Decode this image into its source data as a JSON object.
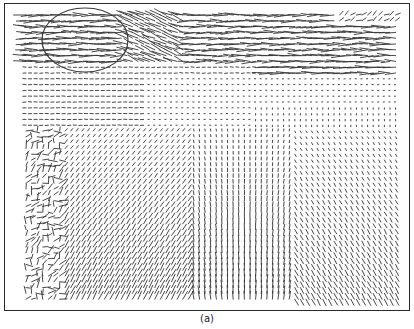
{
  "figure": {
    "caption": "(a)",
    "type": "vector-field",
    "colors": {
      "frame": "#2a2a2a",
      "vectors": "#333333",
      "ellipse": "#3a3a3a",
      "background": "#ffffff"
    },
    "grid": {
      "cols": 68,
      "rows": 50,
      "x0": 22,
      "y0": 12,
      "dx": 5.6,
      "dy": 5.8
    },
    "regions": [
      {
        "name": "top-band-horizontal-flow",
        "y_range": [
          0,
          62
        ],
        "direction": "leftward-horizontal"
      },
      {
        "name": "upper-dots",
        "y_range": [
          62,
          130
        ],
        "direction": "near-zero (dots)"
      },
      {
        "name": "left-turbulent",
        "x_range": [
          0,
          60
        ],
        "y_range": [
          120,
          300
        ],
        "direction": "mixed/turbulent"
      },
      {
        "name": "lower-left-diagonal",
        "y_range": [
          140,
          300
        ],
        "direction": "diagonal up-right"
      },
      {
        "name": "lower-center-vertical",
        "y_range": [
          200,
          300
        ],
        "direction": "vertical"
      },
      {
        "name": "lower-right-diagonal",
        "y_range": [
          180,
          300
        ],
        "direction": "diagonal down-right"
      }
    ],
    "annotation": {
      "shape": "ellipse",
      "cx": 81,
      "cy": 37,
      "rx": 43,
      "ry": 32
    }
  }
}
